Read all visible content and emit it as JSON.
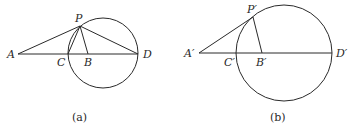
{
  "figures": [
    {
      "caption": "(a)",
      "labels": {
        "A": "A",
        "B": "B",
        "C": "C",
        "D": "D",
        "P": "P"
      },
      "points": {
        "A": [
          18,
          54
        ],
        "C": [
          68,
          54
        ],
        "B": [
          88,
          54
        ],
        "D": [
          138,
          54
        ],
        "P": [
          80,
          26
        ]
      },
      "circle": {
        "cx": 103,
        "cy": 53,
        "r": 35
      },
      "segments": [
        [
          "A",
          "D"
        ],
        [
          "A",
          "P"
        ],
        [
          "P",
          "C"
        ],
        [
          "P",
          "B"
        ],
        [
          "P",
          "D"
        ]
      ]
    },
    {
      "caption": "(b)",
      "labels": {
        "A": "A′",
        "B": "B′",
        "C": "C′",
        "D": "D′",
        "P": "P′"
      },
      "points": {
        "A": [
          199,
          53
        ],
        "C": [
          237,
          53
        ],
        "B": [
          262,
          53
        ],
        "D": [
          332,
          53
        ],
        "P": [
          253,
          17
        ]
      },
      "circle": {
        "cx": 284,
        "cy": 53,
        "r": 48
      },
      "segments": [
        [
          "A",
          "D"
        ],
        [
          "A",
          "P"
        ],
        [
          "P",
          "B"
        ]
      ]
    }
  ]
}
